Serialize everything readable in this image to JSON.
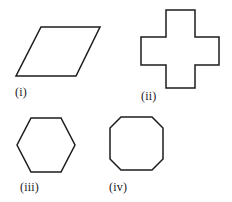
{
  "figure": {
    "width": 232,
    "height": 202,
    "background_color": "#ffffff",
    "stroke_color": "#1c1c1c",
    "stroke_width": 1.5,
    "label_color": "#18181a"
  },
  "shapes": [
    {
      "id": "parallelogram",
      "label": "(i)",
      "name": "parallelogram",
      "points": "41,27 100,27 76,76 16,76"
    },
    {
      "id": "cross",
      "label": "(ii)",
      "name": "cross",
      "points": "166,10 195,10 195,37 219,37 219,65 195,65 195,88 166,88 166,65 141,65 141,37 166,37"
    },
    {
      "id": "hexagon",
      "label": "(iii)",
      "name": "hexagon",
      "points": "31,118 61,118 75,145 61,172 31,172 17,145"
    },
    {
      "id": "octagon",
      "label": "(iv)",
      "name": "octagon",
      "points": "121,117 152,117 163,128 163,159 152,170 121,170 110,159 110,128"
    }
  ]
}
